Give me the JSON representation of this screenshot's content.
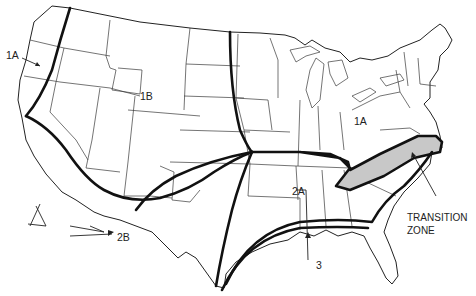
{
  "map": {
    "title": "",
    "subject": "US climate zones map",
    "colors": {
      "background": "#ffffff",
      "state_border": "#3a3a3a",
      "zone_boundary": "#111111",
      "transition_zone_fill": "#c8c8c8"
    },
    "zone_labels": [
      {
        "id": "1A-west",
        "text": "1A"
      },
      {
        "id": "1B",
        "text": "1B"
      },
      {
        "id": "1A-east",
        "text": "1A"
      },
      {
        "id": "2A",
        "text": "2A"
      },
      {
        "id": "2B",
        "text": "2B"
      },
      {
        "id": "3",
        "text": "3"
      }
    ],
    "transition_zone": {
      "line1": "TRANSITION",
      "line2": "ZONE"
    }
  }
}
